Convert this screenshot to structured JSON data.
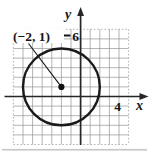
{
  "figure": {
    "type": "coordinate-plane-circle",
    "background_color": "#ffffff",
    "grid": {
      "unit_px": 9.6,
      "x_min": -7,
      "x_max": 5,
      "y_min": -5,
      "y_max": 7,
      "line_color": "#8d8d8d",
      "boundary_dotted": true
    },
    "origin_px": {
      "x": 80.6,
      "y": 96.5
    },
    "axes": {
      "color": "#262626",
      "x_label": "x",
      "y_label": "y",
      "x_tick_label": "4",
      "x_tick_value": 4,
      "y_tick_label": "6",
      "y_tick_value": 6
    },
    "circle": {
      "center_x": -2,
      "center_y": 1,
      "radius": 4,
      "stroke_color": "#1a1a1a",
      "stroke_width": 2.4
    },
    "center_point": {
      "dot_radius_px": 3.1,
      "color": "#111111"
    },
    "center_label": {
      "text": "(−2, 1)",
      "color": "#111111"
    }
  }
}
